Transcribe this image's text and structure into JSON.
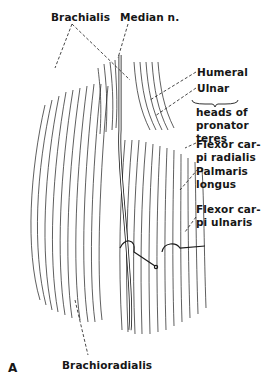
{
  "figure": {
    "panel_letter": "A",
    "labels": {
      "brachialis": "Brachialis",
      "median_nerve": "Median n.",
      "humeral": "Humeral",
      "ulnar": "Ulnar",
      "heads_of": "heads of",
      "pronator": "pronator",
      "teres": "teres",
      "fcr_1": "Flexor car-",
      "fcr_2": "pi radialis",
      "pl_1": "Palmaris",
      "pl_2": "longus",
      "fcu_1": "Flexor car-",
      "fcu_2": "pi ulnaris",
      "brachioradialis": "Brachioradialis"
    },
    "colors": {
      "ink": "#161616",
      "background": "#ffffff"
    }
  }
}
